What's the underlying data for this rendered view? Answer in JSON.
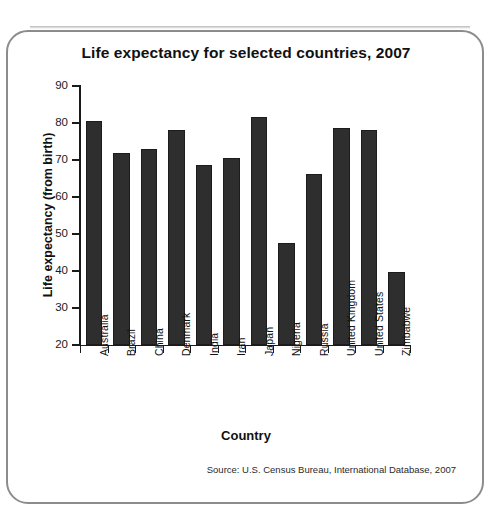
{
  "frame": {
    "border_color": "#8c8c8c",
    "background": "#ffffff"
  },
  "source_note": "Source:  U.S. Census Bureau, International Database, 2007",
  "chart_data": {
    "type": "bar",
    "title": "Life expectancy for selected countries, 2007",
    "xlabel": "Country",
    "ylabel": "Life expectancy (from birth)",
    "ylim": [
      20,
      90
    ],
    "ytick_step": 10,
    "yticks": [
      90,
      80,
      70,
      60,
      50,
      40,
      30,
      20
    ],
    "grid": false,
    "legend": null,
    "bar_color": "#2e2e2e",
    "categories": [
      "Australia",
      "Brazil",
      "China",
      "Denmark",
      "India",
      "Iran",
      "Japan",
      "Nigeria",
      "Russia",
      "United Kingdom",
      "United States",
      "Zimbabwe"
    ],
    "values": [
      80.5,
      72.0,
      73.0,
      78.1,
      68.6,
      70.6,
      81.5,
      47.6,
      66.1,
      78.7,
      78.2,
      39.7
    ]
  }
}
